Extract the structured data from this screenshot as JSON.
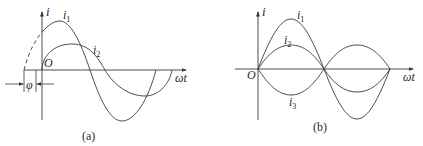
{
  "figure": {
    "panels": [
      {
        "id": "a",
        "caption": "(a)",
        "y_axis_label": "i",
        "x_axis_label": "ωt",
        "origin_label": "O",
        "phase_label": "φ",
        "curves": [
          {
            "name": "i",
            "sub": "1",
            "amplitude": "large",
            "phase": "leading by φ"
          },
          {
            "name": "i",
            "sub": "2",
            "amplitude": "small",
            "phase": "0"
          }
        ]
      },
      {
        "id": "b",
        "caption": "(b)",
        "y_axis_label": "i",
        "x_axis_label": "ωt",
        "origin_label": "O",
        "curves": [
          {
            "name": "i",
            "sub": "1",
            "amplitude": "large",
            "phase": "0"
          },
          {
            "name": "i",
            "sub": "2",
            "amplitude": "small",
            "phase": "0"
          },
          {
            "name": "i",
            "sub": "3",
            "amplitude": "small",
            "phase": "180°"
          }
        ]
      }
    ],
    "colors": {
      "stroke": "#3a3a3a",
      "text": "#2a2a2a",
      "background": "#ffffff"
    }
  }
}
